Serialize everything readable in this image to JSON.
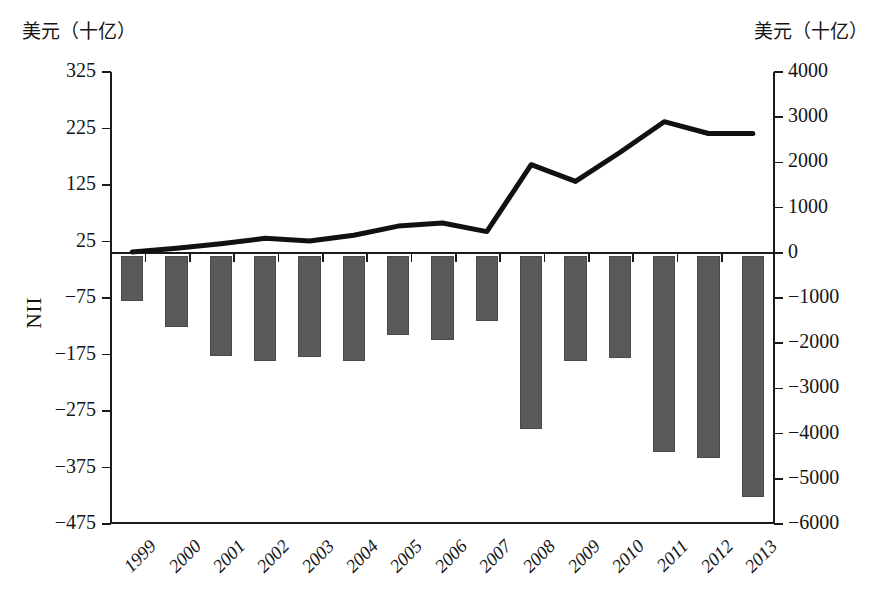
{
  "figure": {
    "left_axis_unit": "美元（十亿）",
    "right_axis_unit": "美元（十亿）",
    "left_axis_name": "NII"
  },
  "chart_data": {
    "type": "bar",
    "title": "",
    "subtitle": "",
    "xlabel": "",
    "ylabel": "NII",
    "y_left_label": "美元（十亿）",
    "y_right_label": "美元（十亿）",
    "grid": false,
    "legend": null,
    "categories": [
      "1999",
      "2000",
      "2001",
      "2002",
      "2003",
      "2004",
      "2005",
      "2006",
      "2007",
      "2008",
      "2009",
      "2010",
      "2011",
      "2012",
      "2013"
    ],
    "left_axis": {
      "name": "NII",
      "unit": "美元（十亿）",
      "ticks": [
        325,
        225,
        125,
        25,
        -75,
        -175,
        -275,
        -375,
        -475
      ],
      "tick_labels": [
        "325",
        "225",
        "125",
        "25",
        "−75",
        "−175",
        "−275",
        "−375",
        "−475"
      ],
      "ylim": [
        -475,
        325
      ]
    },
    "right_axis": {
      "unit": "美元（十亿）",
      "ticks": [
        4000,
        3000,
        2000,
        1000,
        0,
        -1000,
        -2000,
        -3000,
        -4000,
        -5000,
        -6000
      ],
      "tick_labels": [
        "4000",
        "3000",
        "2000",
        "1000",
        "0",
        "−1000",
        "−2000",
        "−3000",
        "−4000",
        "−5000",
        "−6000"
      ],
      "ylim": [
        -6000,
        4000
      ]
    },
    "series": [
      {
        "name": "NII (bars)",
        "type": "bar",
        "axis": "left",
        "color": "#59595b",
        "values": [
          -80,
          -126,
          -178,
          -187,
          -179,
          -186,
          -141,
          -149,
          -115,
          -307,
          -186,
          -182,
          -348,
          -359,
          -427
        ]
      },
      {
        "name": "Gross external position (line)",
        "type": "line",
        "axis": "right",
        "color": "#111111",
        "values": [
          20,
          100,
          200,
          320,
          260,
          390,
          590,
          660,
          470,
          1950,
          1580,
          2220,
          2900,
          2640,
          2640
        ]
      }
    ]
  }
}
